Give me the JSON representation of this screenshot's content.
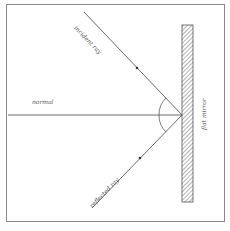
{
  "diagram": {
    "labels": {
      "normal": "normal",
      "incident_ray": "incident ray",
      "reflected_ray": "reflected ray",
      "mirror": "flat mirror"
    },
    "colors": {
      "line": "#444444",
      "frame": "#8a8a8a",
      "mirror_hatch": "#666666",
      "text": "#555555"
    }
  }
}
